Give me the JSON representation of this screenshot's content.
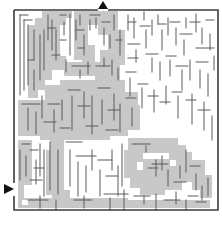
{
  "puzzle": {
    "type": "maze",
    "title": "Maze",
    "entrance_label": "Start",
    "exit_label": "Finish",
    "entrance_arrow": "arrow-right-icon",
    "exit_arrow": "arrow-up-icon"
  },
  "colors": {
    "background": "#ffffff",
    "wall": "#5a5a5a",
    "border": "#3c3c3c",
    "shade": "#c8c8c8",
    "arrow": "#111111"
  }
}
